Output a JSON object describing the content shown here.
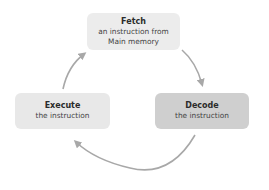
{
  "diagram": {
    "type": "cycle",
    "nodes": [
      {
        "id": "fetch",
        "title": "Fetch",
        "description_line1": "an instruction from",
        "description_line2": "Main memory",
        "fill": "#ececec"
      },
      {
        "id": "decode",
        "title": "Decode",
        "description_line1": "the instruction",
        "fill": "#cfcfcf"
      },
      {
        "id": "execute",
        "title": "Execute",
        "description_line1": "the instruction",
        "fill": "#e8e8e8"
      }
    ],
    "edges": [
      {
        "from": "fetch",
        "to": "decode"
      },
      {
        "from": "decode",
        "to": "execute"
      },
      {
        "from": "execute",
        "to": "fetch"
      }
    ],
    "arrow_color": "#a8a8a8"
  }
}
